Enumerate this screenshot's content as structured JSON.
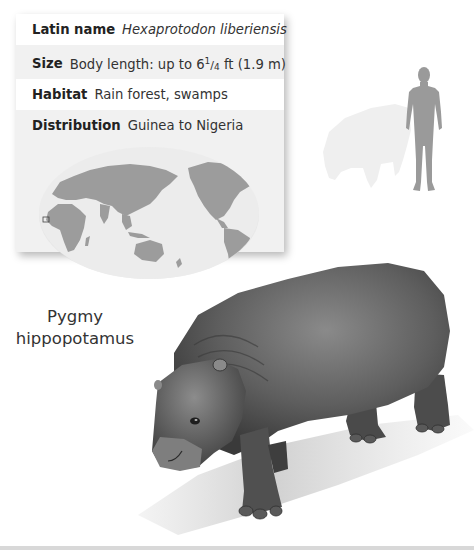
{
  "factfile": {
    "rows": [
      {
        "label": "Latin name",
        "value": "Hexaprotodon liberiensis",
        "italic": true
      },
      {
        "label": "Size",
        "value_pre": "Body length: up to 6",
        "frac_num": "1",
        "frac_sep": "/",
        "frac_den": "4",
        "value_post": " ft (1.9 m)"
      },
      {
        "label": "Habitat",
        "value": "Rain forest, swamps"
      },
      {
        "label": "Distribution",
        "value": "Guinea to Nigeria"
      }
    ],
    "map": {
      "icon": "world-map",
      "highlight_region": "West Africa"
    }
  },
  "species_name": {
    "line1": "Pygmy",
    "line2": "hippopotamus"
  },
  "scale_comparison": {
    "icons": [
      "human-silhouette",
      "hippo-silhouette"
    ]
  },
  "illustration": {
    "subject": "pygmy-hippopotamus"
  },
  "colors": {
    "card_bg": "#f1f1f1",
    "text": "#333333",
    "silhouette_human": "#9a9a9a",
    "silhouette_animal": "#efefef",
    "map_land": "#9c9c9c",
    "map_ocean": "#ececec"
  }
}
